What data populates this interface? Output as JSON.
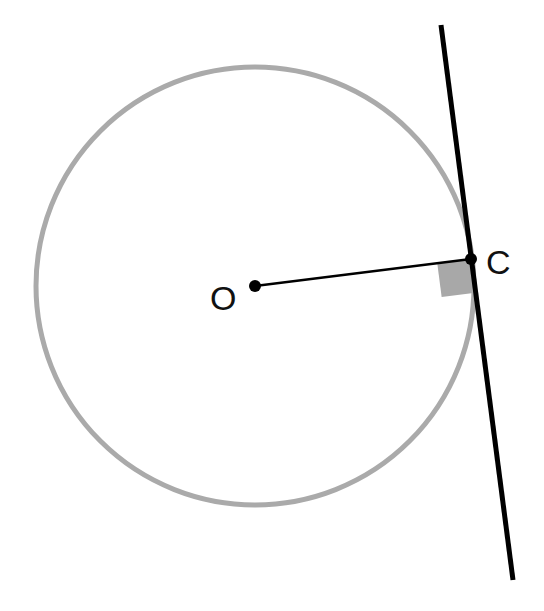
{
  "diagram": {
    "colors": {
      "background": "#ffffff",
      "circle_stroke": "#aaaaaa",
      "line_stroke": "#000000",
      "right_angle_fill": "#a8a8a8",
      "point_fill": "#000000"
    },
    "circle": {
      "cx": 255,
      "cy": 286,
      "r": 219,
      "stroke_width": 5
    },
    "points": [
      {
        "id": "O",
        "label": "O",
        "x": 255,
        "y": 286
      },
      {
        "id": "C",
        "label": "C",
        "x": 471,
        "y": 259
      }
    ],
    "radius_segment": {
      "from": "O",
      "to": "C"
    },
    "tangent_line": {
      "x1": 441,
      "y1": 25,
      "x2": 513,
      "y2": 580,
      "stroke_width": 5
    },
    "right_angle_marker": {
      "at": "C",
      "size": 34
    }
  }
}
